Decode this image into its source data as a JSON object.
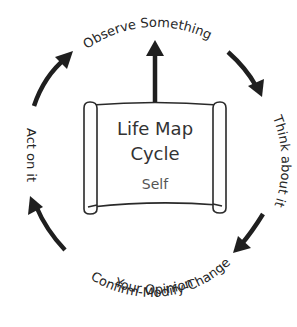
{
  "diagram": {
    "type": "cycle",
    "center": {
      "title_line1": "Life Map",
      "title_line2": "Cycle",
      "subtitle": "Self"
    },
    "steps": [
      {
        "id": "observe",
        "label": "Observe Something"
      },
      {
        "id": "think",
        "label": "Think about it"
      },
      {
        "id": "confirm",
        "label_line1": "Confirm-Modify-Change",
        "label_line2": "Your Opinion"
      },
      {
        "id": "act",
        "label": "Act on it"
      }
    ],
    "colors": {
      "arrow": "#1f1f1f",
      "text": "#262626",
      "scroll_stroke": "#2a2a2a"
    }
  }
}
